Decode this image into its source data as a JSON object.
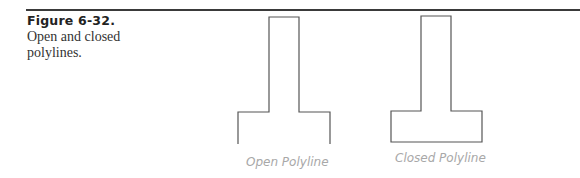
{
  "figure": {
    "number": "Figure 6-32.",
    "caption": "Open and closed polylines."
  },
  "shapes": [
    {
      "name": "open-polyline",
      "label": "Open Polyline"
    },
    {
      "name": "closed-polyline",
      "label": "Closed Polyline"
    }
  ],
  "colors": {
    "rule": "#3a3a3a",
    "stroke": "#555555",
    "label": "#a8a8a8"
  }
}
